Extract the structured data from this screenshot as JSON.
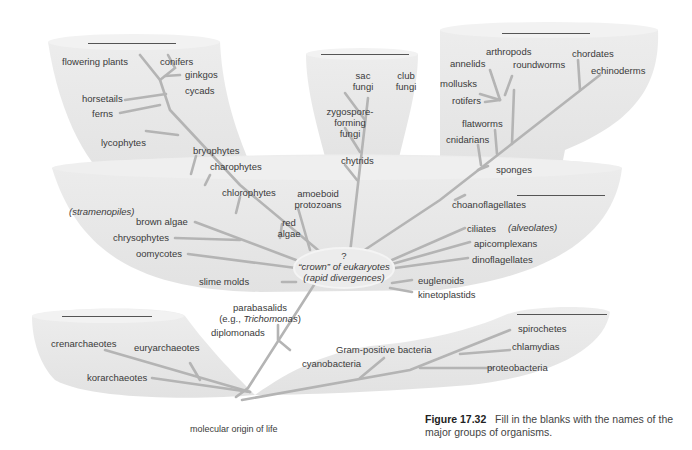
{
  "figure": {
    "number": "Figure 17.32",
    "caption": "Fill in the blanks with the names of the major groups of organisms.",
    "root_label": "molecular origin of life"
  },
  "center_node": {
    "question": "?",
    "line1": "“crown” of eukaryotes",
    "line2": "(rapid divergences)"
  },
  "groups": {
    "plants": {
      "blank": "",
      "labels": [
        "flowering plants",
        "conifers",
        "ginkgos",
        "cycads",
        "horsetails",
        "ferns",
        "lycophytes",
        "bryophytes",
        "charophytes"
      ]
    },
    "fungi": {
      "blank": "",
      "labels": [
        "sac fungi",
        "club fungi",
        "zygospore-forming fungi",
        "chytrids"
      ]
    },
    "animals": {
      "blank": "",
      "labels": [
        "arthropods",
        "annelids",
        "roundworms",
        "mollusks",
        "rotifers",
        "chordates",
        "echinoderms",
        "flatworms",
        "cnidarians",
        "sponges"
      ]
    },
    "protists": {
      "blank": "",
      "labels": [
        "chlorophytes",
        "amoeboid protozoans",
        "red algae",
        "(stramenopiles)",
        "brown algae",
        "chrysophytes",
        "oomycotes",
        "slime molds",
        "choanoflagellates",
        "ciliates",
        "(alveolates)",
        "apicomplexans",
        "dinoflagellates",
        "euglenoids",
        "kinetoplastids",
        "parabasalids (e.g., Trichomonas)",
        "diplomonads"
      ]
    },
    "archaea": {
      "blank": "",
      "labels": [
        "crenarchaeotes",
        "euryarchaeotes",
        "korarchaeotes"
      ]
    },
    "bacteria": {
      "blank": "",
      "labels": [
        "spirochetes",
        "chlamydias",
        "Gram-positive bacteria",
        "cyanobacteria",
        "proteobacteria"
      ]
    }
  },
  "colors": {
    "shape_fill": "#e8e8e8",
    "shape_edge": "#f2f2f2",
    "branch": "#b4b4b4",
    "text": "#3a3a3a",
    "blank_line": "#555555"
  }
}
